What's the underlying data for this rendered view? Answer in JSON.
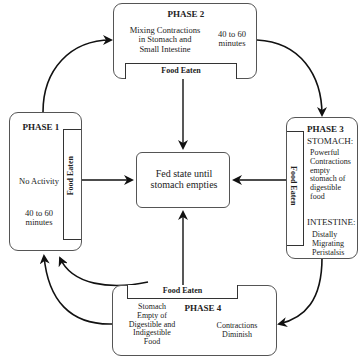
{
  "diagram": {
    "center": {
      "label_line1": "Fed state until",
      "label_line2": "stomach empties"
    },
    "phase1": {
      "title": "PHASE 1",
      "activity": "No Activity",
      "duration_line1": "40 to 60",
      "duration_line2": "minutes",
      "food_eaten": "Food Eaten"
    },
    "phase2": {
      "title": "PHASE 2",
      "activity_line1": "Mixing Contractions",
      "activity_line2": "in Stomach and",
      "activity_line3": "Small Intestine",
      "duration_line1": "40 to 60",
      "duration_line2": "minutes",
      "food_eaten": "Food Eaten"
    },
    "phase3": {
      "title": "PHASE 3",
      "stomach_heading": "STOMACH:",
      "stomach_line1": "Powerful",
      "stomach_line2": "Contractions",
      "stomach_line3": "empty",
      "stomach_line4": "stomach of",
      "stomach_line5": "digestible",
      "stomach_line6": "food",
      "intestine_heading": "INTESTINE:",
      "intestine_line1": "Distally",
      "intestine_line2": "Migrating",
      "intestine_line3": "Peristalsis",
      "food_eaten": "Food Eaten"
    },
    "phase4": {
      "title": "PHASE 4",
      "left_line1": "Stomach",
      "left_line2": "Empty of",
      "left_line3": "Digestible and",
      "left_line4": "Indigestible",
      "left_line5": "Food",
      "right_line1": "Contractions",
      "right_line2": "Diminish",
      "food_eaten": "Food Eaten"
    },
    "connectors": [
      {
        "from": "phase1",
        "to": "phase2",
        "type": "curved"
      },
      {
        "from": "phase2",
        "to": "phase3",
        "type": "curved"
      },
      {
        "from": "phase3",
        "to": "phase4",
        "type": "curved"
      },
      {
        "from": "phase4",
        "to": "phase1",
        "type": "curved"
      },
      {
        "from": "phase1-food-eaten",
        "to": "center",
        "type": "straight"
      },
      {
        "from": "phase2-food-eaten",
        "to": "center",
        "type": "straight"
      },
      {
        "from": "phase3-food-eaten",
        "to": "center",
        "type": "straight"
      },
      {
        "from": "phase4-food-eaten",
        "to": "center",
        "type": "straight"
      },
      {
        "from": "center",
        "to": "phase1",
        "type": "curved"
      }
    ]
  }
}
